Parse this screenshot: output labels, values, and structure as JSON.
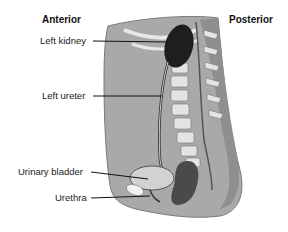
{
  "diagram": {
    "orientation": {
      "left": "Anterior",
      "right": "Posterior"
    },
    "labels": [
      {
        "id": "left-kidney",
        "text": "Left kidney"
      },
      {
        "id": "left-ureter",
        "text": "Left ureter"
      },
      {
        "id": "urinary-bladder",
        "text": "Urinary bladder"
      },
      {
        "id": "urethra",
        "text": "Urethra"
      }
    ],
    "colors": {
      "body_fill": "#a9a9a9",
      "body_shade": "#8f8f8f",
      "kidney": "#1e1e1e",
      "rectum": "#4a4a4a",
      "vertebra": "#e4e4e4",
      "bladder": "#d2d2d2",
      "leader_line": "#111111"
    }
  }
}
